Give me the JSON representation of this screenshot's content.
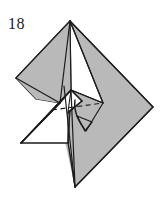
{
  "figure": {
    "step_number": "18",
    "type": "origami-folding-diagram",
    "caption": "",
    "colors": {
      "paper_front": "#b9b9b9",
      "paper_back": "#ffffff",
      "outline": "#1c1c1c",
      "fold_line": "#1c1c1c",
      "hidden_line": "#1c1c1c",
      "arrow": "#1c1c1c",
      "background": "#ffffff",
      "label": "#1a1a1a"
    },
    "geometry": {
      "apex": [
        70,
        21
      ],
      "left_corner": [
        16,
        78
      ],
      "right_corner": [
        153,
        107
      ],
      "bottom_point": [
        75,
        187
      ],
      "inner_peak": [
        71,
        90
      ],
      "inner_right": [
        103,
        103
      ],
      "white_left_vertex": [
        21,
        143
      ],
      "vertical_line_x": 68,
      "vertical_line_bottom_y": 143
    },
    "annotations": {
      "arrow_label": "fold-down-arrow",
      "arrow_direction": "down",
      "arrow_tip": [
        87,
        128
      ],
      "arrow_tail": [
        78,
        100
      ],
      "hidden_edge_label": "dashed-hidden-crease"
    }
  }
}
